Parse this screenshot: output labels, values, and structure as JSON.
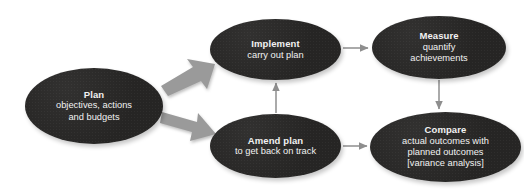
{
  "diagram": {
    "background_color": "#ffffff",
    "node_fill_color": "#262524",
    "node_text_color": "#f2f2f2",
    "block_arrow_color": "#9a9a9a",
    "line_arrow_color": "#8e8e8e",
    "nodes": [
      {
        "id": "plan",
        "title": "Plan",
        "lines": [
          "objectives, actions",
          "and budgets"
        ]
      },
      {
        "id": "implement",
        "title": "Implement",
        "lines": [
          "carry out plan"
        ]
      },
      {
        "id": "measure",
        "title": "Measure",
        "lines": [
          "quantify",
          "achievements"
        ]
      },
      {
        "id": "amend",
        "title": "Amend plan",
        "lines": [
          "to get back on track"
        ]
      },
      {
        "id": "compare",
        "title": "Compare",
        "lines": [
          "actual outcomes with",
          "planned outcomes",
          "[variance analysis]"
        ]
      }
    ],
    "connectors": [
      {
        "id": "plan-to-implement",
        "from": "plan",
        "to": "implement",
        "style": "block-arrow",
        "direction": "up-right"
      },
      {
        "id": "plan-to-amend",
        "from": "plan",
        "to": "amend",
        "style": "block-arrow",
        "direction": "down-right"
      },
      {
        "id": "implement-to-measure",
        "from": "implement",
        "to": "measure",
        "style": "line-arrow",
        "direction": "right"
      },
      {
        "id": "measure-to-compare",
        "from": "measure",
        "to": "compare",
        "style": "line-arrow",
        "direction": "down"
      },
      {
        "id": "amend-to-compare",
        "from": "amend",
        "to": "compare",
        "style": "line-arrow",
        "direction": "right"
      },
      {
        "id": "amend-to-implement",
        "from": "amend",
        "to": "implement",
        "style": "line-arrow",
        "direction": "up"
      }
    ]
  }
}
